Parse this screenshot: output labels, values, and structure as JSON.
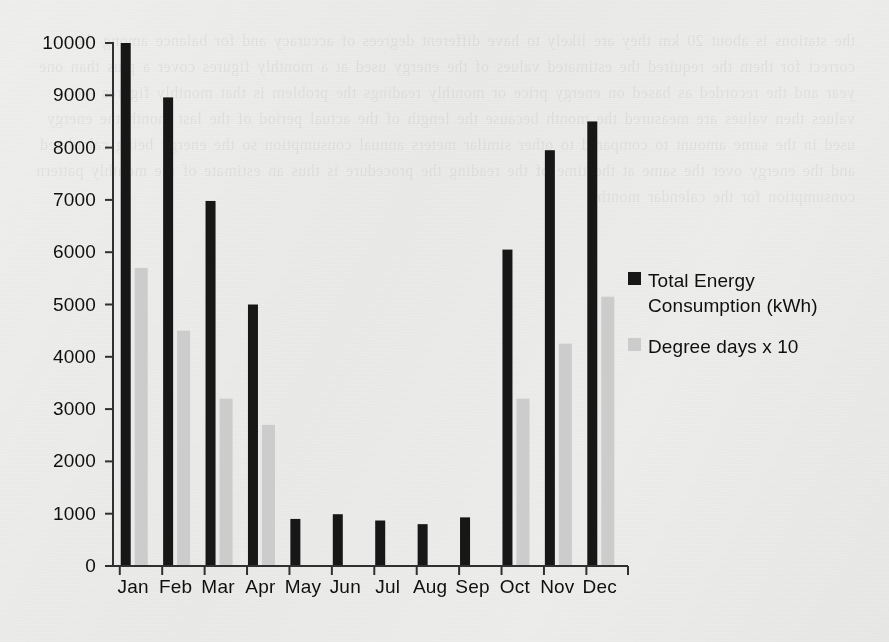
{
  "chart_data": {
    "type": "bar",
    "title": "",
    "subtitle": "",
    "xlabel": "",
    "ylabel": "",
    "categories": [
      "Jan",
      "Feb",
      "Mar",
      "Apr",
      "May",
      "Jun",
      "Jul",
      "Aug",
      "Sep",
      "Oct",
      "Nov",
      "Dec"
    ],
    "series": [
      {
        "name": "Total Energy Consumption (kWh)",
        "color": "#1b1b1b",
        "values": [
          10000,
          8960,
          6980,
          5000,
          900,
          990,
          870,
          800,
          930,
          6050,
          7950,
          8500
        ]
      },
      {
        "name": "Degree days x 10",
        "color": "#c9c9c9",
        "values": [
          5700,
          4500,
          3200,
          2700,
          0,
          0,
          0,
          0,
          0,
          3200,
          4250,
          5150
        ]
      }
    ],
    "ylim": [
      0,
      10000
    ],
    "ytick_values": [
      0,
      1000,
      2000,
      3000,
      4000,
      5000,
      6000,
      7000,
      8000,
      9000,
      10000
    ],
    "ytick_labels": [
      "0",
      "1000",
      "2000",
      "3000",
      "4000",
      "5000",
      "6000",
      "7000",
      "8000",
      "9000",
      "10000"
    ],
    "grid": false,
    "legend_position": "right-inside",
    "bar_style": "overlap"
  },
  "legend": {
    "entries": [
      {
        "label": "Total Energy Consumption (kWh)",
        "color": "#1b1b1b",
        "swatch": "square-marker"
      },
      {
        "label": "Degree days x 10",
        "color": "#c9c9c9",
        "swatch": "square-marker"
      }
    ]
  },
  "axes": {
    "y_axis_name": "value-axis",
    "x_axis_name": "month-axis"
  },
  "colors": {
    "series_primary": "#1b1b1b",
    "series_secondary": "#c9c9c9",
    "axis": "#333333",
    "background": "#ececeb",
    "text": "#141414"
  },
  "ghost_bleed_text": "the stations is about 20 km they are likely to have different degrees of accuracy and for balance among the correct for them the required the estimated values of the energy used at a monthly figures cover a plus than one year and the recorded as based on energy price or monthly readings the problem is that monthly figures are values then values are measured the month because the length of the actual period of the last month the energy used in the same amount to compared to other similar meters annual consumption so the energy being calculated and the energy over the same at the time of the reading the procedure is thus an estimate of the monthly pattern consumption for the calendar months"
}
